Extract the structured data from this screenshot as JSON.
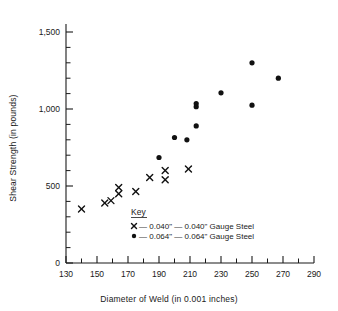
{
  "chart_data": {
    "type": "scatter",
    "title": "",
    "xlabel": "Diameter of Weld (in 0.001 inches)",
    "ylabel": "Shear Strength (in pounds)",
    "xlim": [
      130,
      290
    ],
    "ylim": [
      0,
      1500
    ],
    "x_major_ticks": [
      130,
      150,
      170,
      190,
      210,
      230,
      250,
      270,
      290
    ],
    "x_tick_labels": [
      "130",
      "150",
      "170",
      "190",
      "210",
      "230",
      "250",
      "270",
      "290"
    ],
    "x_minor_step": 10,
    "y_major_ticks": [
      0,
      500,
      1000,
      1500
    ],
    "y_tick_labels": [
      "0",
      "500",
      "1,000",
      "1,500"
    ],
    "y_minor_step": 100,
    "grid": false,
    "legend_position": "inside-lower-center",
    "series": [
      {
        "name": "0.040\" — 0.040\" Gauge Steel",
        "marker": "x",
        "color": "#111111",
        "points": [
          [
            140,
            350
          ],
          [
            155,
            390
          ],
          [
            159,
            405
          ],
          [
            164,
            490
          ],
          [
            164,
            450
          ],
          [
            175,
            465
          ],
          [
            184,
            555
          ],
          [
            194,
            600
          ],
          [
            194,
            540
          ],
          [
            209,
            610
          ]
        ]
      },
      {
        "name": "0.064\" — 0.064\" Gauge Steel",
        "marker": "dot",
        "color": "#111111",
        "points": [
          [
            190,
            685
          ],
          [
            200,
            815
          ],
          [
            208,
            800
          ],
          [
            214,
            1035
          ],
          [
            214,
            1015
          ],
          [
            214,
            890
          ],
          [
            230,
            1105
          ],
          [
            250,
            1300
          ],
          [
            250,
            1025
          ],
          [
            267,
            1200
          ]
        ]
      }
    ]
  },
  "axes": {
    "y_title": "Shear Strength (in pounds)",
    "x_title": "Diameter of Weld (in 0.001 inches)",
    "y_labels": [
      "1,500",
      "1,000",
      "500",
      "0"
    ],
    "x_labels": [
      "130",
      "150",
      "170",
      "190",
      "210",
      "230",
      "250",
      "270",
      "290"
    ]
  },
  "key": {
    "title": "Key",
    "entries": [
      {
        "symbol": "x",
        "label": "— 0.040\" — 0.040\" Gauge Steel"
      },
      {
        "symbol": "dot",
        "label": "— 0.064\" — 0.064\" Gauge Steel"
      }
    ]
  },
  "colors": {
    "marker": "#111111",
    "axis": "#1a1a1a",
    "background": "#ffffff"
  }
}
